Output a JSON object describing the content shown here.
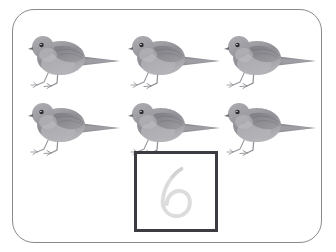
{
  "worksheet": {
    "type": "counting-and-number-trace",
    "background_color": "#ffffff",
    "frame": {
      "shape": "rounded-rectangle",
      "border_color": "#8a8a8e",
      "fill_color": "#ffffff"
    },
    "object_name": "bird",
    "object_count": 6,
    "object_color": "#8d8d92",
    "rows": 2,
    "columns": 3,
    "birds": [
      {
        "id": "bird-1",
        "row": 1,
        "column": 1,
        "label": "bird"
      },
      {
        "id": "bird-2",
        "row": 1,
        "column": 2,
        "label": "bird"
      },
      {
        "id": "bird-3",
        "row": 1,
        "column": 3,
        "label": "bird"
      },
      {
        "id": "bird-4",
        "row": 2,
        "column": 1,
        "label": "bird"
      },
      {
        "id": "bird-5",
        "row": 2,
        "column": 2,
        "label": "bird"
      },
      {
        "id": "bird-6",
        "row": 2,
        "column": 3,
        "label": "bird"
      }
    ],
    "answer_box": {
      "numeral": "6",
      "style": "faint-trace-guide",
      "border_color": "#3b3b42",
      "fill_color": "#ffffff",
      "numeral_color": "#dcdcdc"
    }
  }
}
